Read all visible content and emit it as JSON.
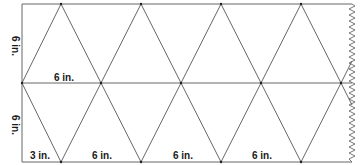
{
  "diagram": {
    "labels": {
      "top_height": "6 in.",
      "bottom_height": "6 in.",
      "middle_width": "6 in.",
      "bottom_half": "3 in.",
      "bottom_1": "6 in.",
      "bottom_2": "6 in.",
      "bottom_3": "6 in."
    },
    "colors": {
      "line": "#555555",
      "text": "#1a1a1a",
      "background": "#ffffff"
    }
  }
}
